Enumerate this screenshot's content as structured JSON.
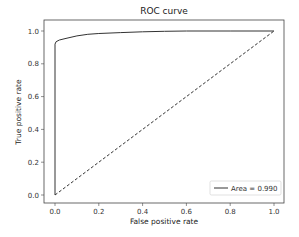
{
  "chart_data": {
    "type": "line",
    "title": "ROC curve",
    "xlabel": "False positive rate",
    "ylabel": "True positive rate",
    "xlim": [
      -0.05,
      1.05
    ],
    "ylim": [
      -0.05,
      1.05
    ],
    "xticks": [
      "0.0",
      "0.2",
      "0.4",
      "0.6",
      "0.8",
      "1.0"
    ],
    "yticks": [
      "0.0",
      "0.2",
      "0.4",
      "0.6",
      "0.8",
      "1.0"
    ],
    "grid": false,
    "legend_position": "lower right",
    "series": [
      {
        "name": "Area = 0.990",
        "style": "solid",
        "color": "#333333",
        "x": [
          0.0,
          0.0,
          0.005,
          0.02,
          0.05,
          0.1,
          0.15,
          0.2,
          0.3,
          0.4,
          0.5,
          0.6,
          0.8,
          1.0
        ],
        "y": [
          0.0,
          0.92,
          0.935,
          0.945,
          0.955,
          0.97,
          0.98,
          0.985,
          0.99,
          0.995,
          0.998,
          1.0,
          1.0,
          1.0
        ]
      },
      {
        "name": "chance",
        "style": "dashed",
        "color": "#333333",
        "x": [
          0.0,
          1.0
        ],
        "y": [
          0.0,
          1.0
        ]
      }
    ]
  },
  "legend": {
    "label": "Area = 0.990"
  }
}
